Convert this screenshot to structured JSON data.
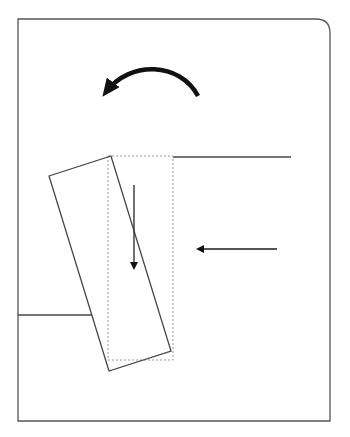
{
  "diagram": {
    "colors": {
      "stroke": "#444444",
      "arrow": "#111111",
      "dotted": "#999999",
      "background": "#ffffff"
    },
    "frame": {
      "x": 18,
      "y": 19,
      "width": 312,
      "height": 402,
      "corner_radius": 14
    },
    "ledges": {
      "top_right": {
        "x1": 173,
        "y1": 157,
        "x2": 291,
        "y2": 157
      },
      "bottom_left": {
        "x1": 18,
        "y1": 315,
        "x2": 92,
        "y2": 315
      }
    },
    "slot_outline_dotted": {
      "x": 108,
      "y": 156,
      "width": 65,
      "height": 204
    },
    "rotated_block": {
      "points": "49,176 111,156 171,351 109,371"
    },
    "arrows": {
      "rotation": {
        "type": "counterclockwise"
      },
      "down": {
        "x": 134,
        "y1": 185,
        "y2": 271
      },
      "left": {
        "y": 249,
        "x1": 277,
        "x2": 194
      }
    }
  }
}
